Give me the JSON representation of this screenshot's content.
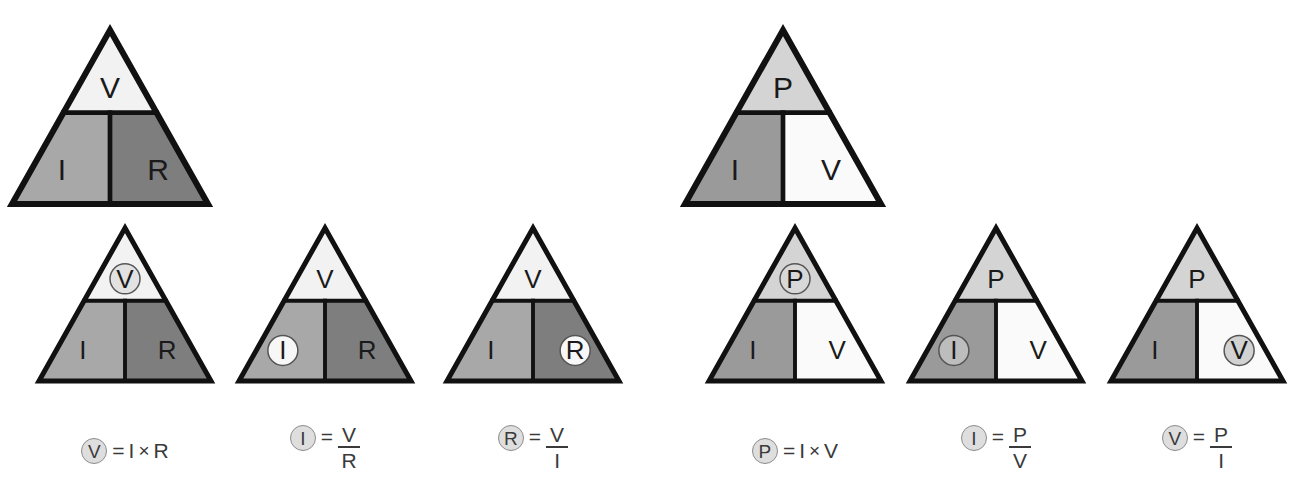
{
  "page": {
    "title_fragment": "",
    "background": "#ffffff",
    "width": 1309,
    "height": 491
  },
  "palette": {
    "outline": "#111111",
    "very_light": "#f2f2f2",
    "light_gray": "#d4d4d4",
    "mid_gray": "#a8a8a8",
    "mid_dark_gray": "#9a9a9a",
    "dark_gray": "#7e7e7e",
    "circle_fill_light": "#f7f7f7",
    "circle_fill_gray": "#d2d2d2",
    "circle_stroke": "#555555",
    "text": "#1a1a1a",
    "formula_text": "#3a3a3a"
  },
  "groups": [
    {
      "id": "ohms-law",
      "name": "ohms-law-group",
      "master": {
        "name": "ohms-law-master-triangle",
        "top": {
          "label": "V",
          "fill": "#f2f2f2",
          "circled": false
        },
        "bottom_left": {
          "label": "I",
          "fill": "#a8a8a8",
          "circled": false
        },
        "bottom_right": {
          "label": "R",
          "fill": "#7e7e7e",
          "circled": false
        }
      },
      "variants": [
        {
          "name": "solve-for-v-triangle",
          "top": {
            "label": "V",
            "fill": "#f2f2f2",
            "circled": true,
            "circle_fill": "#e2e2e2"
          },
          "bottom_left": {
            "label": "I",
            "fill": "#a8a8a8",
            "circled": false
          },
          "bottom_right": {
            "label": "R",
            "fill": "#7e7e7e",
            "circled": false
          },
          "formula": {
            "subject": "V",
            "equals": "=",
            "kind": "product",
            "operand_a": "I",
            "operator": "×",
            "operand_b": "R"
          }
        },
        {
          "name": "solve-for-i-triangle",
          "top": {
            "label": "V",
            "fill": "#f2f2f2",
            "circled": false
          },
          "bottom_left": {
            "label": "I",
            "fill": "#a8a8a8",
            "circled": true,
            "circle_fill": "#f7f7f7"
          },
          "bottom_right": {
            "label": "R",
            "fill": "#7e7e7e",
            "circled": false
          },
          "formula": {
            "subject": "I",
            "equals": "=",
            "kind": "fraction",
            "numerator": "V",
            "denominator": "R"
          }
        },
        {
          "name": "solve-for-r-triangle",
          "top": {
            "label": "V",
            "fill": "#f2f2f2",
            "circled": false
          },
          "bottom_left": {
            "label": "I",
            "fill": "#a8a8a8",
            "circled": false
          },
          "bottom_right": {
            "label": "R",
            "fill": "#7e7e7e",
            "circled": true,
            "circle_fill": "#f7f7f7"
          },
          "formula": {
            "subject": "R",
            "equals": "=",
            "kind": "fraction",
            "numerator": "V",
            "denominator": "I"
          }
        }
      ]
    },
    {
      "id": "power-law",
      "name": "power-law-group",
      "master": {
        "name": "power-law-master-triangle",
        "top": {
          "label": "P",
          "fill": "#d4d4d4",
          "circled": false
        },
        "bottom_left": {
          "label": "I",
          "fill": "#9a9a9a",
          "circled": false
        },
        "bottom_right": {
          "label": "V",
          "fill": "#fafafa",
          "circled": false
        }
      },
      "variants": [
        {
          "name": "solve-for-p-triangle",
          "top": {
            "label": "P",
            "fill": "#d4d4d4",
            "circled": true,
            "circle_fill": "#d8d8d8"
          },
          "bottom_left": {
            "label": "I",
            "fill": "#9a9a9a",
            "circled": false
          },
          "bottom_right": {
            "label": "V",
            "fill": "#fafafa",
            "circled": false
          },
          "formula": {
            "subject": "P",
            "equals": "=",
            "kind": "product",
            "operand_a": "I",
            "operator": "×",
            "operand_b": "V"
          }
        },
        {
          "name": "solve-for-i-power-triangle",
          "top": {
            "label": "P",
            "fill": "#d4d4d4",
            "circled": false
          },
          "bottom_left": {
            "label": "I",
            "fill": "#9a9a9a",
            "circled": true,
            "circle_fill": "#bdbdbd"
          },
          "bottom_right": {
            "label": "V",
            "fill": "#fafafa",
            "circled": false
          },
          "formula": {
            "subject": "I",
            "equals": "=",
            "kind": "fraction",
            "numerator": "P",
            "denominator": "V"
          }
        },
        {
          "name": "solve-for-v-power-triangle",
          "top": {
            "label": "P",
            "fill": "#d4d4d4",
            "circled": false
          },
          "bottom_left": {
            "label": "I",
            "fill": "#9a9a9a",
            "circled": false
          },
          "bottom_right": {
            "label": "V",
            "fill": "#fafafa",
            "circled": true,
            "circle_fill": "#d2d2d2"
          },
          "formula": {
            "subject": "V",
            "equals": "=",
            "kind": "fraction",
            "numerator": "P",
            "denominator": "I"
          }
        }
      ]
    }
  ]
}
